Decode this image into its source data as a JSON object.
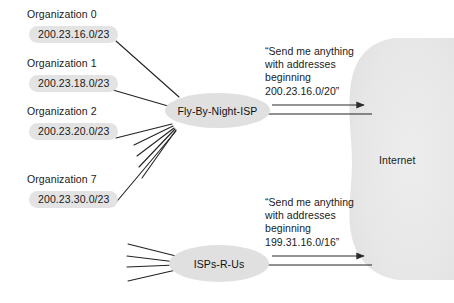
{
  "diagram": {
    "organizations": [
      {
        "name": "Organization 0",
        "prefix": "200.23.16.0/23"
      },
      {
        "name": "Organization 1",
        "prefix": "200.23.18.0/23"
      },
      {
        "name": "Organization 2",
        "prefix": "200.23.20.0/23"
      },
      {
        "name": "Organization 7",
        "prefix": "200.23.30.0/23"
      }
    ],
    "isps": [
      {
        "id": "fly-by-night",
        "label": "Fly-By-Night-ISP"
      },
      {
        "id": "isps-r-us",
        "label": "ISPs-R-Us"
      }
    ],
    "annotations": [
      {
        "id": "advertisement-fly-by-night",
        "lines": [
          "“Send me anything",
          "with addresses",
          "beginning",
          "200.23.16.0/20”"
        ],
        "prefix": "200.23.16.0/20"
      },
      {
        "id": "advertisement-isps-r-us",
        "lines": [
          "“Send me anything",
          "with addresses",
          "beginning",
          "199.31.16.0/16”"
        ],
        "prefix": "199.31.16.0/16"
      }
    ],
    "cloud": {
      "label": "Internet"
    },
    "colors": {
      "background": "#ffffff",
      "node_fill": "#e0e0e0",
      "pill_fill": "#e3e3e3",
      "cloud_fill": "#e8e8e8",
      "line": "#222222",
      "text": "#1a1a1a"
    }
  }
}
